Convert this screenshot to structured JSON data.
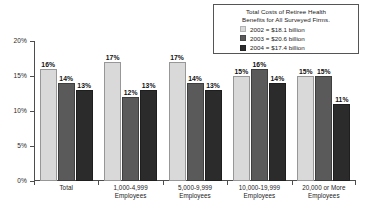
{
  "chart_data": {
    "type": "bar",
    "title": "",
    "xlabel": "",
    "ylabel": "",
    "ylim": [
      0,
      20
    ],
    "ytick_labels": [
      "0%",
      "5%",
      "10%",
      "15%",
      "20%"
    ],
    "ytick_values": [
      0,
      5,
      10,
      15,
      20
    ],
    "grid": false,
    "legend_position": "top-right",
    "categories": [
      "Total",
      "1,000-4,999 Employees",
      "5,000-9,999 Employees",
      "10,000-19,999 Employees",
      "20,000 or More Employees"
    ],
    "category_lines": [
      [
        "Total",
        ""
      ],
      [
        "1,000-4,999",
        "Employees"
      ],
      [
        "5,000-9,999",
        "Employees"
      ],
      [
        "10,000-19,999",
        "Employees"
      ],
      [
        "20,000 or More",
        "Employees"
      ]
    ],
    "series": [
      {
        "name": "2002",
        "color": "#d9d9d9",
        "values": [
          16,
          17,
          17,
          15,
          15
        ],
        "labels": [
          "16%",
          "17%",
          "17%",
          "15%",
          "15%"
        ]
      },
      {
        "name": "2003",
        "color": "#5a5a5a",
        "values": [
          14,
          12,
          14,
          16,
          15
        ],
        "labels": [
          "14%",
          "12%",
          "14%",
          "16%",
          "15%"
        ]
      },
      {
        "name": "2004",
        "color": "#2b2b2b",
        "values": [
          13,
          13,
          13,
          14,
          11
        ],
        "labels": [
          "13%",
          "13%",
          "13%",
          "14%",
          "11%"
        ]
      }
    ]
  },
  "legend": {
    "title_line1": "Total Costs of Retiree Health",
    "title_line2": "Benefits for All Surveyed Firms.",
    "entries": [
      {
        "label": "2002 = $18.1 billion",
        "color": "#d9d9d9"
      },
      {
        "label": "2003 = $5a5a5a",
        "color": "#5a5a5a"
      },
      {
        "label": "2004 = $17.4 billion",
        "color": "#2b2b2b"
      }
    ],
    "entry_labels": [
      "2002 = $18.1 billion",
      "2003 = $20.6 billion",
      "2004 = $17.4 billion"
    ]
  }
}
